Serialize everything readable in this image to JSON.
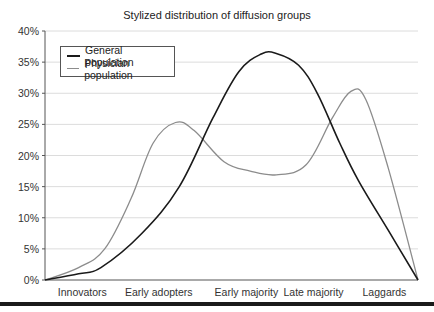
{
  "chart_data": {
    "type": "line",
    "title": "Stylized distribution of diffusion groups",
    "xlabel": "",
    "ylabel": "",
    "categories": [
      "Innovators",
      "Early adopters",
      "Early majority",
      "Late majority",
      "Laggards"
    ],
    "category_positions": [
      0.1,
      0.305,
      0.54,
      0.72,
      0.91
    ],
    "ylim": [
      0,
      40
    ],
    "yticks": [
      "0%",
      "5%",
      "10%",
      "15%",
      "20%",
      "25%",
      "30%",
      "35%",
      "40%"
    ],
    "grid": true,
    "legend_position": "upper left",
    "series": [
      {
        "name": "General population",
        "color": "#1a1a1a",
        "x": [
          0,
          0.09,
          0.15,
          0.26,
          0.36,
          0.45,
          0.52,
          0.58,
          0.62,
          0.68,
          0.73,
          0.79,
          0.84,
          0.92,
          1.0
        ],
        "values": [
          0,
          1.0,
          2.0,
          7.5,
          15,
          26,
          33.5,
          36.3,
          36.4,
          34.5,
          30,
          22,
          16,
          8,
          0
        ]
      },
      {
        "name": "Physician population",
        "color": "#8c8c8c",
        "x": [
          0,
          0.09,
          0.16,
          0.23,
          0.29,
          0.35,
          0.4,
          0.48,
          0.55,
          0.62,
          0.7,
          0.77,
          0.82,
          0.86,
          0.92,
          1.0
        ],
        "values": [
          0,
          2.0,
          5,
          13,
          22,
          25.3,
          24,
          19,
          17.5,
          16.9,
          18.5,
          26,
          30.3,
          29,
          18,
          0
        ]
      }
    ]
  },
  "legend": {
    "items": [
      {
        "label": "General population",
        "color": "#1a1a1a"
      },
      {
        "label": "Physician population",
        "color": "#8c8c8c"
      }
    ]
  }
}
